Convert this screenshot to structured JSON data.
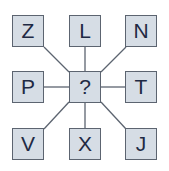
{
  "puzzle": {
    "cells": [
      {
        "id": "top-left",
        "letter": "Z",
        "x": 12,
        "y": 15
      },
      {
        "id": "top-center",
        "letter": "L",
        "x": 69,
        "y": 15
      },
      {
        "id": "top-right",
        "letter": "N",
        "x": 125,
        "y": 15
      },
      {
        "id": "middle-left",
        "letter": "P",
        "x": 12,
        "y": 71
      },
      {
        "id": "center",
        "letter": "?",
        "x": 69,
        "y": 71
      },
      {
        "id": "middle-right",
        "letter": "T",
        "x": 125,
        "y": 71
      },
      {
        "id": "bottom-left",
        "letter": "V",
        "x": 12,
        "y": 128
      },
      {
        "id": "bottom-center",
        "letter": "X",
        "x": 69,
        "y": 128
      },
      {
        "id": "bottom-right",
        "letter": "J",
        "x": 125,
        "y": 128
      }
    ],
    "colors": {
      "box_fill": "#d6dde5",
      "box_border": "#5c6470",
      "line": "#5c6470",
      "text": "#1f2a44"
    }
  }
}
